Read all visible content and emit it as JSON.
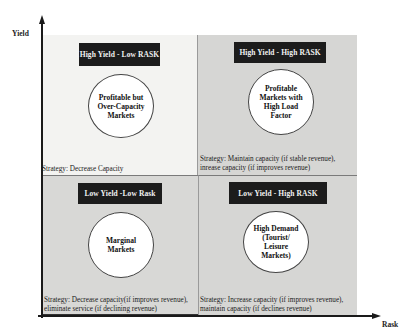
{
  "axes": {
    "y_label": "Yield",
    "x_label": "Rask"
  },
  "quadrants": {
    "top_left": {
      "header": "High Yield  - Low RASK",
      "circle_lines": [
        "Profitable but",
        "Over-Capacity",
        "Markets"
      ],
      "strategy_lines": [
        "Strategy: Decrease Capacity"
      ]
    },
    "top_right": {
      "header": "High Yield  - High RASK",
      "circle_lines": [
        "Profitable",
        "Markets with",
        "High Load",
        "Factor"
      ],
      "strategy_lines": [
        "Strategy: Maintain capacity (if stable revenue),",
        "inrease capacity (if improves revenue)"
      ]
    },
    "bottom_left": {
      "header": "Low Yield -Low Rask",
      "circle_lines": [
        "Marginal",
        "Markets"
      ],
      "strategy_lines": [
        "Strategy: Decrease capacity(if improves revenue),",
        "eliminate service (if declining revenue)"
      ]
    },
    "bottom_right": {
      "header": "Low Yield - High RASK",
      "circle_lines": [
        "High Demand",
        "(Tourist/",
        "Leisure",
        "Markets)"
      ],
      "strategy_lines": [
        "Strategy: Increase capacity (if improves revenue),",
        "maintain capacity (if declines revenue)"
      ]
    }
  },
  "colors": {
    "header_bg": "#1c1c1c",
    "header_text": "#f2f2f2",
    "quadrant_light": "#f3f3f1",
    "quadrant_gray": "#d6d6d4",
    "axis": "#1a1a1a"
  }
}
